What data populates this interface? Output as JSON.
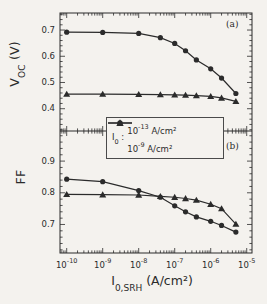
{
  "colors": {
    "ink": "#2b2b2b",
    "paper": "#f4f2ee"
  },
  "figure": {
    "voc_axis_label": {
      "main": "V",
      "sub": "OC",
      "rest": " (V)"
    },
    "ff_axis_label": "FF",
    "x_axis_label": {
      "main": "I",
      "sub": "0,SRH",
      "rest": " (A/cm²)"
    }
  },
  "chart_data": {
    "type": "line",
    "x_scale": "log",
    "x_axis_title": "I_0,SRH (A/cm2)",
    "x_lim_log": [
      -10.186,
      -4.853
    ],
    "x": [
      1e-10,
      1e-09,
      1e-08,
      4e-08,
      1e-07,
      2e-07,
      4e-07,
      1e-06,
      2e-06,
      5e-06
    ],
    "x_ticks": [
      {
        "v": 1e-10,
        "base": "10",
        "exp": "-10"
      },
      {
        "v": 1e-09,
        "base": "10",
        "exp": "-9"
      },
      {
        "v": 1e-08,
        "base": "10",
        "exp": "-8"
      },
      {
        "v": 1e-07,
        "base": "10",
        "exp": "-7"
      },
      {
        "v": 1e-06,
        "base": "10",
        "exp": "-6"
      },
      {
        "v": 1e-05,
        "base": "10",
        "exp": "-5"
      }
    ],
    "grid": false,
    "legend_position": "center-between-panels",
    "panels": [
      {
        "id": "a",
        "corner_label": "(a)",
        "y_label": "V_OC (V)",
        "y_lim": [
          0.315,
          0.765
        ],
        "y_minor_step": 0.02,
        "y_ticks": [
          {
            "v": 0.7,
            "label": "0.7"
          },
          {
            "v": 0.6,
            "label": "0.6"
          },
          {
            "v": 0.5,
            "label": "0.5"
          },
          {
            "v": 0.4,
            "label": "0.4"
          }
        ],
        "series": [
          {
            "name": "I0 = 10^-13 A/cm2",
            "marker": "circle",
            "values": [
              0.692,
              0.691,
              0.687,
              0.671,
              0.649,
              0.621,
              0.586,
              0.552,
              0.517,
              0.458
            ]
          },
          {
            "name": "I0 = 10^-9 A/cm2",
            "marker": "triangle",
            "values": [
              0.456,
              0.456,
              0.455,
              0.454,
              0.453,
              0.452,
              0.45,
              0.447,
              0.441,
              0.428
            ]
          }
        ]
      },
      {
        "id": "b",
        "corner_label": "(b)",
        "y_label": "FF",
        "y_lim": [
          0.61,
          0.995
        ],
        "y_minor_step": 0.02,
        "y_ticks": [
          {
            "v": 0.9,
            "label": "0.9"
          },
          {
            "v": 0.8,
            "label": "0.8"
          },
          {
            "v": 0.7,
            "label": "0.7"
          }
        ],
        "series": [
          {
            "name": "I0 = 10^-13 A/cm2",
            "marker": "circle",
            "values": [
              0.843,
              0.835,
              0.807,
              0.786,
              0.759,
              0.74,
              0.724,
              0.71,
              0.697,
              0.676
            ]
          },
          {
            "name": "I0 = 10^-9 A/cm2",
            "marker": "triangle",
            "values": [
              0.795,
              0.794,
              0.793,
              0.789,
              0.786,
              0.782,
              0.777,
              0.764,
              0.75,
              0.701
            ]
          }
        ]
      }
    ],
    "legend": {
      "title": {
        "main": "I",
        "sub": "0",
        "rest": " :"
      },
      "entries": [
        {
          "marker": "circle",
          "base": "10",
          "exp": "-13",
          "rest": " A/cm²"
        },
        {
          "marker": "triangle",
          "base": "10",
          "exp": "-9",
          "rest": " A/cm²"
        }
      ]
    }
  }
}
